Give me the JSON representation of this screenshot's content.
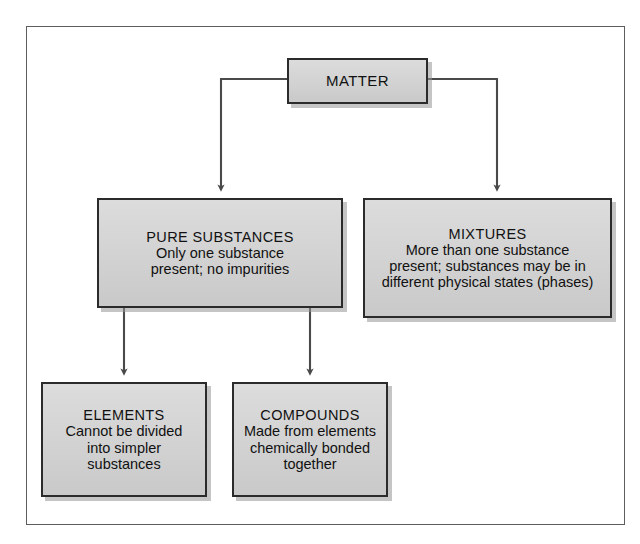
{
  "figure": {
    "kind": "flowchart",
    "orientation": "top-down",
    "frame_color": "#5d5d5d",
    "box_fill": "#d4d4d4",
    "box_border": "#2b2b2b",
    "connector_color": "#4a4a4a",
    "background": "#ffffff"
  },
  "nodes": {
    "matter": {
      "title": "MATTER",
      "description": ""
    },
    "pure_substances": {
      "title": "PURE SUBSTANCES",
      "line1": "Only one substance",
      "line2": "present; no impurities"
    },
    "mixtures": {
      "title": "MIXTURES",
      "line1": "More than one substance",
      "line2": "present; substances may be in",
      "line3": "different physical states (phases)"
    },
    "elements": {
      "title": "ELEMENTS",
      "line1": "Cannot be divided",
      "line2": "into simpler",
      "line3": "substances"
    },
    "compounds": {
      "title": "COMPOUNDS",
      "line1": "Made from elements",
      "line2": "chemically bonded",
      "line3": "together"
    }
  },
  "edges": [
    {
      "id": "matter-to-pure",
      "from": "matter",
      "to": "pure_substances",
      "style": "elbow-left-down",
      "arrow": true
    },
    {
      "id": "matter-to-mixtures",
      "from": "matter",
      "to": "mixtures",
      "style": "elbow-right-down",
      "arrow": true
    },
    {
      "id": "pure-to-elements",
      "from": "pure_substances",
      "to": "elements",
      "style": "straight-down",
      "arrow": true
    },
    {
      "id": "pure-to-compounds",
      "from": "pure_substances",
      "to": "compounds",
      "style": "straight-down",
      "arrow": true
    }
  ]
}
